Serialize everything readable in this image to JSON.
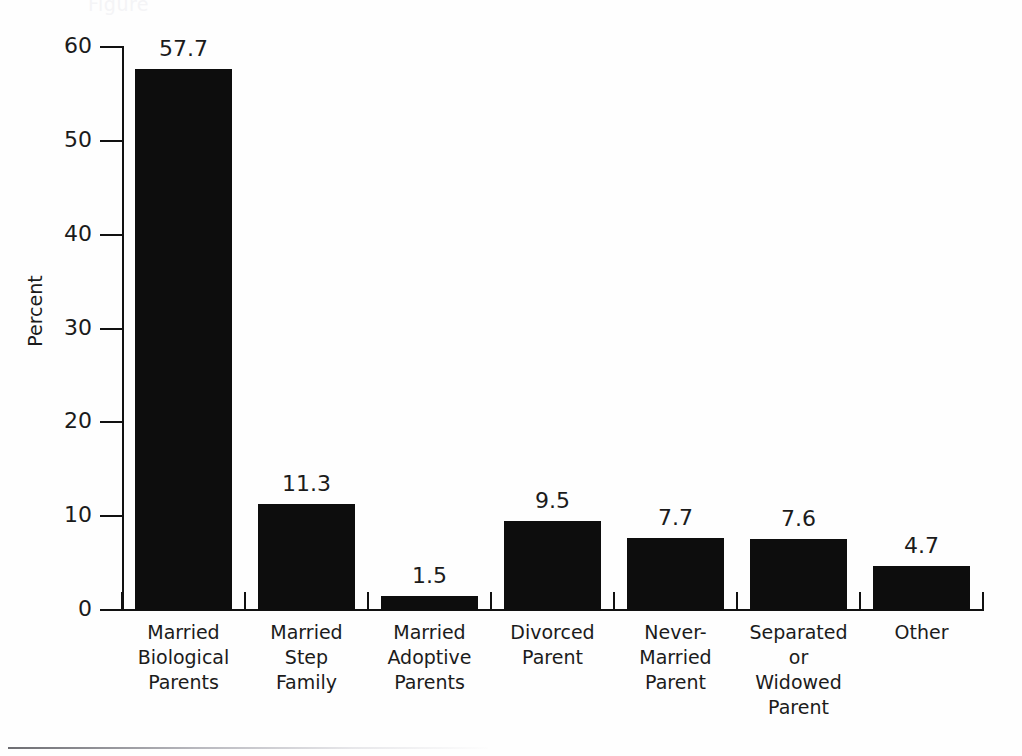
{
  "ghost_title": "Figure",
  "chart_data": {
    "type": "bar",
    "title": "",
    "xlabel": "",
    "ylabel": "Percent",
    "ylim": [
      0,
      60
    ],
    "yticks": [
      0,
      10,
      20,
      30,
      40,
      50,
      60
    ],
    "grid": false,
    "legend": "none",
    "bar_color": "#0d0d0d",
    "categories": [
      "Married\nBiological\nParents",
      "Married\nStep\nFamily",
      "Married\nAdoptive\nParents",
      "Divorced\nParent",
      "Never-\nMarried\nParent",
      "Separated\nor\nWidowed\nParent",
      "Other"
    ],
    "category_lines": [
      [
        "Married",
        "Biological",
        "Parents"
      ],
      [
        "Married",
        "Step",
        "Family"
      ],
      [
        "Married",
        "Adoptive",
        "Parents"
      ],
      [
        "Divorced",
        "Parent"
      ],
      [
        "Never-",
        "Married",
        "Parent"
      ],
      [
        "Separated",
        "or",
        "Widowed",
        "Parent"
      ],
      [
        "Other"
      ]
    ],
    "values": [
      57.7,
      11.3,
      1.5,
      9.5,
      7.7,
      7.6,
      4.7
    ],
    "value_labels": [
      "57.7",
      "11.3",
      "1.5",
      "9.5",
      "7.7",
      "7.6",
      "4.7"
    ]
  }
}
